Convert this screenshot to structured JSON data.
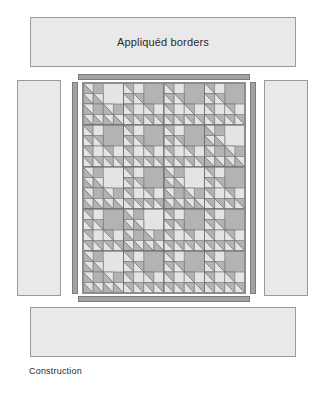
{
  "figure": {
    "caption": "Construction",
    "border_label": "Appliquéd borders"
  },
  "colors": {
    "page_background": "#ffffff",
    "panel_fill": "#e9e9e9",
    "panel_stroke": "#9a9a9a",
    "strip_fill": "#a2a2a2",
    "strip_stroke": "#7c7c7c",
    "block_light": "#e4e4e4",
    "block_dark": "#b3b3b3",
    "block_stroke": "#6f6f6f",
    "center_stroke": "#8d8d8d",
    "text": "#2b2b2b"
  },
  "panels": [
    {
      "name": "top-appliqued-border",
      "label": "Appliquéd borders"
    },
    {
      "name": "left-appliqued-border",
      "label": ""
    },
    {
      "name": "right-appliqued-border",
      "label": ""
    },
    {
      "name": "bottom-appliqued-border",
      "label": ""
    }
  ],
  "sashing_strips": [
    {
      "name": "top-sashing-strip"
    },
    {
      "name": "bottom-sashing-strip"
    },
    {
      "name": "left-sashing-strip"
    },
    {
      "name": "right-sashing-strip"
    }
  ],
  "quilt": {
    "name": "quilt-center",
    "columns": 4,
    "rows": 5,
    "block_name": "recursive-triangle-block",
    "recursion_depth": 3,
    "block_shading": [
      [
        "light",
        "dark",
        "dark",
        "dark"
      ],
      [
        "dark",
        "dark",
        "dark",
        "light"
      ],
      [
        "light",
        "dark",
        "light",
        "dark"
      ],
      [
        "dark",
        "light",
        "dark",
        "dark"
      ],
      [
        "light",
        "dark",
        "dark",
        "dark"
      ]
    ]
  }
}
